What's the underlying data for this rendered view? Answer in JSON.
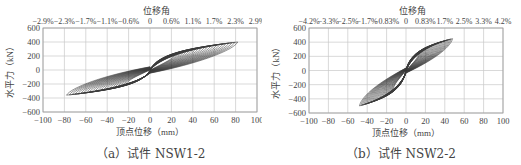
{
  "chart_data": [
    {
      "type": "line",
      "subtype": "hysteresis",
      "caption": "（a）试件 NSW1-2",
      "caption_label": "a",
      "caption_text": "试件 NSW1-2",
      "xlabel": "顶点位移（mm）",
      "ylabel": "水平力（kN）",
      "top_axis_label": "位移角",
      "xlim": [
        -100,
        100
      ],
      "ylim": [
        -600,
        600
      ],
      "x_ticks": [
        -100,
        -80,
        -60,
        -40,
        -20,
        0,
        20,
        40,
        60,
        80,
        100
      ],
      "y_ticks": [
        600,
        400,
        200,
        0,
        -200,
        -400,
        -600
      ],
      "top_ticks": [
        "-2.9%",
        "-2.3%",
        "-1.7%",
        "-1.1%",
        "-0.6%",
        "0",
        "0.6%",
        "1.1%",
        "1.7%",
        "2.3%",
        "2.9%"
      ],
      "grid": true,
      "series": [
        {
          "name": "hysteresis envelope (approx.)",
          "x": [
            -78,
            -70,
            -60,
            -40,
            -20,
            0,
            20,
            40,
            60,
            70,
            82
          ],
          "y": [
            -230,
            -330,
            -370,
            -300,
            -200,
            0,
            190,
            280,
            350,
            380,
            400
          ]
        }
      ],
      "peak_positive": {
        "x": 82,
        "y": 400
      },
      "peak_negative": {
        "x": -78,
        "y": -380
      }
    },
    {
      "type": "line",
      "subtype": "hysteresis",
      "caption": "（b）试件 NSW2-2",
      "caption_label": "b",
      "caption_text": "试件 NSW2-2",
      "xlabel": "顶点位移（mm）",
      "ylabel": "水平力（kN）",
      "top_axis_label": "位移角",
      "xlim": [
        -100,
        100
      ],
      "ylim": [
        -600,
        600
      ],
      "x_ticks": [
        -100,
        -80,
        -60,
        -40,
        -20,
        0,
        20,
        40,
        60,
        80,
        100
      ],
      "y_ticks": [
        600,
        400,
        200,
        0,
        -200,
        -400,
        -600
      ],
      "top_ticks": [
        "-4.2%",
        "-3.3%",
        "-2.5%",
        "-1.7%",
        "-0.83%",
        "0",
        "0.83%",
        "1.7%",
        "2.5%",
        "3.3%",
        "4.2%"
      ],
      "grid": true,
      "series": [
        {
          "name": "hysteresis envelope (approx.)",
          "x": [
            -48,
            -40,
            -30,
            -20,
            -10,
            0,
            10,
            20,
            30,
            40,
            50
          ],
          "y": [
            -500,
            -420,
            -330,
            -250,
            -170,
            0,
            200,
            320,
            400,
            450,
            420
          ]
        }
      ],
      "peak_positive": {
        "x": 45,
        "y": 460
      },
      "peak_negative": {
        "x": -48,
        "y": -500
      }
    }
  ]
}
